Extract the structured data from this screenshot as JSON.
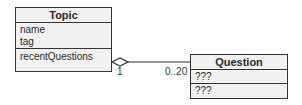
{
  "diagram": {
    "type": "UML class diagram",
    "classes": [
      {
        "name": "Topic",
        "attributes": [
          "name",
          "tag"
        ],
        "operations_section": [
          "recentQuestions"
        ]
      },
      {
        "name": "Question",
        "attributes": [
          "???"
        ],
        "operations_section": [
          "???"
        ]
      }
    ],
    "association": {
      "kind": "aggregation",
      "from": "Topic",
      "to": "Question",
      "from_multiplicity": "1",
      "to_multiplicity": "0..20"
    }
  }
}
